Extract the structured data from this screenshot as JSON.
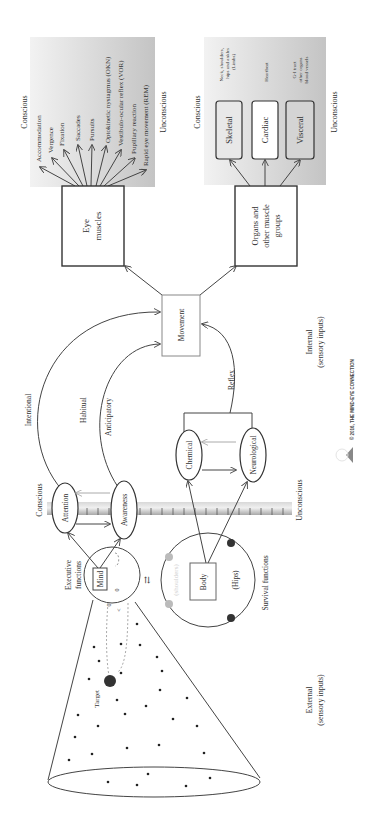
{
  "figure": {
    "orientation": "rotated-90-ccw",
    "copyright": "© 2016, THE MIND-EYE CONNECTION"
  },
  "regions": {
    "external": "External",
    "external_sub": "(sensory inputs)",
    "internal": "Internal",
    "internal_sub": "(sensory inputs)",
    "conscious": "Conscious",
    "unconscious": "Unconscious"
  },
  "visual_field": {
    "target_label": "Target"
  },
  "mind": {
    "label": "Mind",
    "caption_line1": "Executive",
    "caption_line2": "functions",
    "glyph_a": "0",
    "glyph_b": "0",
    "glyph_c": "<"
  },
  "body": {
    "label": "Body",
    "shoulders": "(shoulders)",
    "hips": "(Hips)",
    "caption": "Survival functions"
  },
  "awareness_scale": {
    "conscious_label": "Conscious",
    "unconscious_label": "Unconscious",
    "attention": "Attention",
    "awareness": "Awareness"
  },
  "signals": {
    "chemical": "Chemical",
    "neurological": "Neurological"
  },
  "pathways": {
    "intentional": "Intentional",
    "habitual": "Habitual",
    "anticipatory": "Anticipatory",
    "reflex": "Reflex"
  },
  "movement": {
    "label": "Movement"
  },
  "eye_muscles": {
    "label_line1": "Eye",
    "label_line2": "muscles",
    "conscious": "Conscious",
    "unconscious": "Unconscious",
    "functions": [
      "Accommodation",
      "Vergence",
      "Fixation",
      "Saccades",
      "Pursuits",
      "Optokinetic nystagmus (OKN)",
      "Vestibulo-ocular reflex (VOR)",
      "Pupillary reaction",
      "Rapid eye movement (REM)"
    ]
  },
  "organs": {
    "label_line1": "Organs and",
    "label_line2": "other muscle",
    "label_line3": "groups",
    "conscious": "Conscious",
    "unconscious": "Unconscious",
    "types": [
      {
        "name": "Skeletal",
        "note_lines": [
          "Neck, shoulders,",
          "hips and ankles",
          "(Limbs)"
        ]
      },
      {
        "name": "Cardiac",
        "note_lines": [
          "Heartbeat"
        ]
      },
      {
        "name": "Visceral",
        "note_lines": [
          "G-I tract",
          "other organs",
          "blood vessels"
        ]
      }
    ]
  }
}
